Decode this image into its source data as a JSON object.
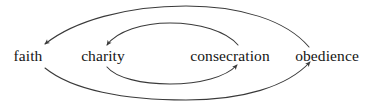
{
  "diagram": {
    "background_color": "#ffffff",
    "stroke_color": "#3a3a3a",
    "text_color": "#151515",
    "nodes": [
      {
        "id": "faith",
        "label": "faith",
        "cx": 28,
        "cy": 56
      },
      {
        "id": "charity",
        "label": "charity",
        "cx": 103,
        "cy": 56
      },
      {
        "id": "consecration",
        "label": "consecration",
        "cx": 230,
        "cy": 56
      },
      {
        "id": "obedience",
        "label": "obedience",
        "cx": 327,
        "cy": 56
      }
    ],
    "edges": [
      {
        "id": "outer-top",
        "from": "obedience",
        "to": "faith",
        "arrowhead_at": "faith",
        "direction": "right-to-left",
        "loop": "outer"
      },
      {
        "id": "outer-bottom",
        "from": "faith",
        "to": "obedience",
        "arrowhead_at": "obedience",
        "direction": "left-to-right",
        "loop": "outer"
      },
      {
        "id": "inner-top",
        "from": "consecration",
        "to": "charity",
        "arrowhead_at": "charity",
        "direction": "right-to-left",
        "loop": "inner"
      },
      {
        "id": "inner-bottom",
        "from": "charity",
        "to": "consecration",
        "arrowhead_at": "consecration",
        "direction": "left-to-right",
        "loop": "inner"
      }
    ]
  }
}
